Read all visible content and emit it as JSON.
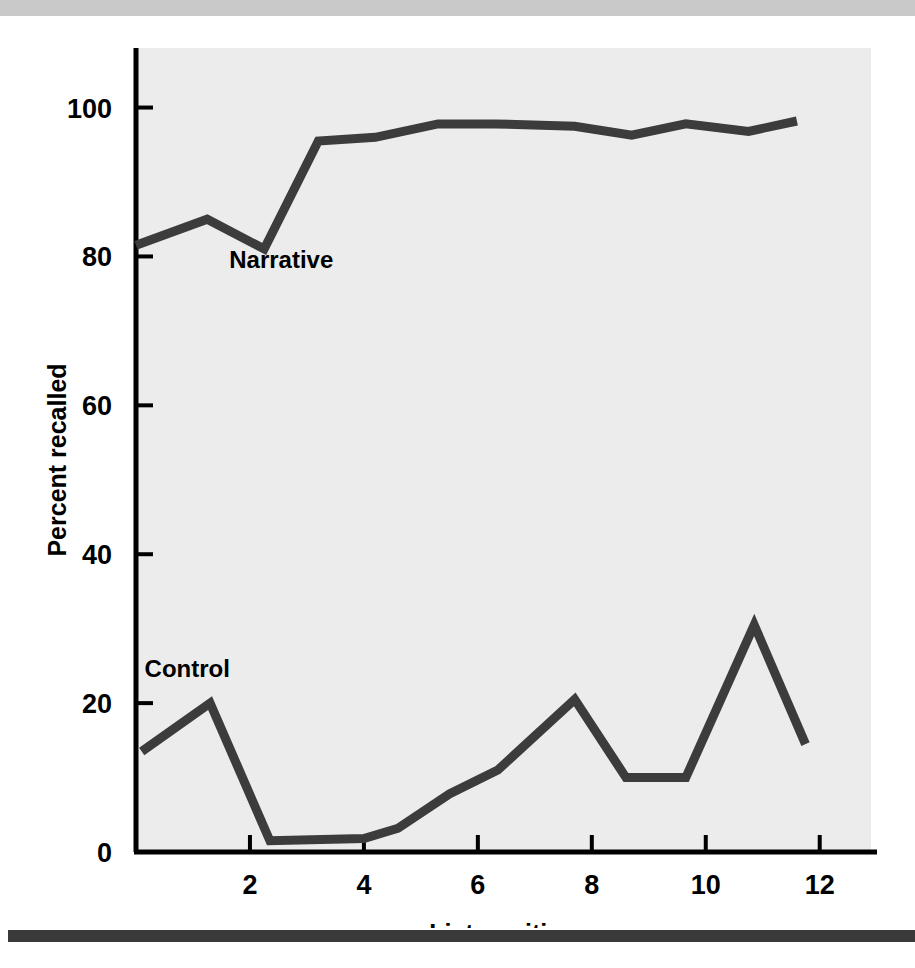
{
  "figure": {
    "background_color": "#ffffff",
    "top_rule_color": "#c9c9c9",
    "bottom_rule_color": "#3a3a3a",
    "plot_background_color": "#ececec",
    "axis_color": "#000000",
    "line_color": "#3c3c3c"
  },
  "chart_data": {
    "type": "line",
    "title": "",
    "xlabel": "List position",
    "ylabel": "Percent recalled",
    "xlim": [
      0,
      12.9
    ],
    "ylim": [
      0,
      108
    ],
    "xticks": [
      2,
      4,
      6,
      8,
      10,
      12
    ],
    "yticks": [
      0,
      20,
      40,
      60,
      80,
      100
    ],
    "xtick_labels": [
      "2",
      "4",
      "6",
      "8",
      "10",
      "12"
    ],
    "ytick_labels": [
      "0",
      "20",
      "40",
      "60",
      "80",
      "100"
    ],
    "grid": false,
    "legend": "inline-annotations",
    "series": [
      {
        "name": "Narrative",
        "label_x": 2.55,
        "label_y": 78.5,
        "x": [
          0.0,
          1.25,
          2.25,
          3.2,
          4.2,
          5.3,
          6.3,
          7.7,
          8.7,
          9.65,
          10.75,
          11.6
        ],
        "values": [
          81.5,
          85.0,
          81.0,
          95.5,
          96.0,
          97.8,
          97.8,
          97.5,
          96.3,
          97.8,
          96.8,
          98.2
        ]
      },
      {
        "name": "Control",
        "label_x": 0.9,
        "label_y": 23.5,
        "x": [
          0.1,
          1.3,
          2.35,
          4.0,
          4.6,
          5.5,
          6.35,
          7.7,
          8.6,
          9.65,
          10.85,
          11.75
        ],
        "values": [
          13.5,
          20.0,
          1.5,
          1.8,
          3.2,
          7.8,
          11.0,
          20.5,
          10.0,
          10.0,
          30.5,
          14.5
        ]
      }
    ]
  }
}
